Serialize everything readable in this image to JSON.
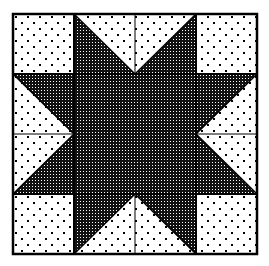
{
  "diagram": {
    "title": "Sawtooth Star quilt block",
    "kind": "quilt-block",
    "grid": {
      "columns": 4,
      "rows": 4
    },
    "bounds": {
      "x": 13,
      "y": 14,
      "width": 244,
      "height": 240
    },
    "colors": {
      "background": "#ffffff",
      "line": "#000000",
      "dark_fabric_base": "#1a1a1a",
      "light_fabric_base": "#ffffff"
    },
    "fabrics": {
      "light": {
        "name": "dotted",
        "description": "white with staggered black dots"
      },
      "dark": {
        "name": "checker",
        "description": "dense black with white dots"
      }
    },
    "pieces": {
      "corners": [
        {
          "position": "top-left",
          "fabric": "light"
        },
        {
          "position": "top-right",
          "fabric": "light"
        },
        {
          "position": "bottom-left",
          "fabric": "light"
        },
        {
          "position": "bottom-right",
          "fabric": "light"
        }
      ],
      "flying_geese": [
        {
          "position": "top",
          "goose_fabric": "light",
          "sky_fabric": "dark",
          "points": "down"
        },
        {
          "position": "bottom",
          "goose_fabric": "light",
          "sky_fabric": "dark",
          "points": "up"
        },
        {
          "position": "left",
          "goose_fabric": "light",
          "sky_fabric": "dark",
          "points": "right"
        },
        {
          "position": "right",
          "goose_fabric": "light",
          "sky_fabric": "dark",
          "points": "left"
        }
      ],
      "center": {
        "fabric": "dark",
        "span": "2x2"
      }
    }
  }
}
